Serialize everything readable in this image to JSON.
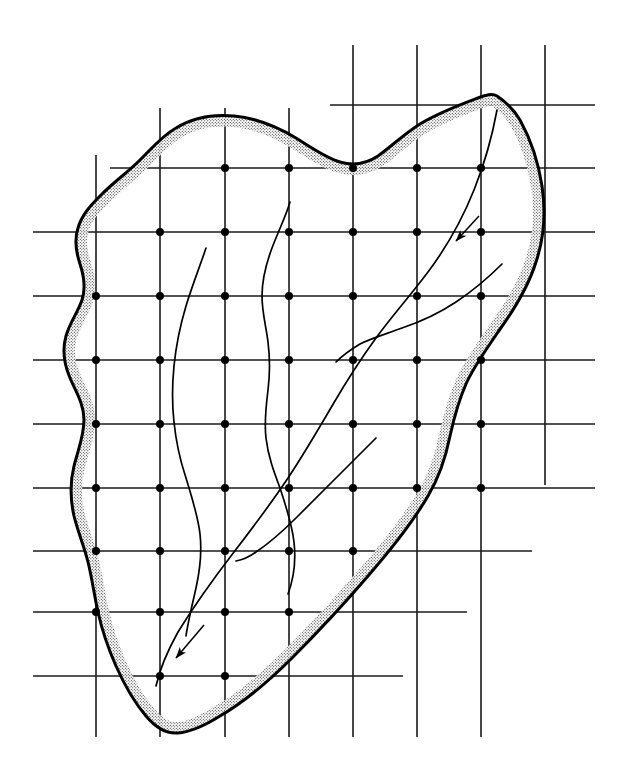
{
  "figure": {
    "kind": "watershed-grid-overlay-diagram",
    "title": "",
    "caption": "",
    "background_color": "#ffffff",
    "ink_color": "#000000",
    "stipple_color": "#000000",
    "canvas": {
      "width": 625,
      "height": 771
    }
  },
  "grid": {
    "name": "sampling-grid",
    "spacing_px": 64,
    "line_color": "#1a1a1a",
    "line_width": 1.6,
    "vertical_lines": [
      {
        "x": 96,
        "y1": 155,
        "y2": 737
      },
      {
        "x": 160,
        "y1": 108,
        "y2": 737
      },
      {
        "x": 225,
        "y1": 108,
        "y2": 737
      },
      {
        "x": 289,
        "y1": 108,
        "y2": 737
      },
      {
        "x": 353,
        "y1": 45,
        "y2": 737
      },
      {
        "x": 417,
        "y1": 45,
        "y2": 737
      },
      {
        "x": 481,
        "y1": 45,
        "y2": 737
      },
      {
        "x": 545,
        "y1": 45,
        "y2": 485
      }
    ],
    "horizontal_lines": [
      {
        "y": 105,
        "x1": 330,
        "x2": 595
      },
      {
        "y": 168,
        "x1": 110,
        "x2": 595
      },
      {
        "y": 232,
        "x1": 33,
        "x2": 595
      },
      {
        "y": 296,
        "x1": 33,
        "x2": 595
      },
      {
        "y": 360,
        "x1": 33,
        "x2": 595
      },
      {
        "y": 424,
        "x1": 33,
        "x2": 595
      },
      {
        "y": 488,
        "x1": 33,
        "x2": 595
      },
      {
        "y": 551,
        "x1": 33,
        "x2": 532
      },
      {
        "y": 612,
        "x1": 33,
        "x2": 467
      },
      {
        "y": 676,
        "x1": 33,
        "x2": 403
      }
    ],
    "node_dot_radius": 4.0,
    "node_dot_color": "#000000",
    "interior_nodes": [
      {
        "x": 225,
        "y": 168
      },
      {
        "x": 289,
        "y": 168
      },
      {
        "x": 353,
        "y": 168
      },
      {
        "x": 417,
        "y": 168
      },
      {
        "x": 481,
        "y": 168
      },
      {
        "x": 160,
        "y": 232
      },
      {
        "x": 225,
        "y": 232
      },
      {
        "x": 289,
        "y": 232
      },
      {
        "x": 353,
        "y": 232
      },
      {
        "x": 417,
        "y": 232
      },
      {
        "x": 481,
        "y": 232
      },
      {
        "x": 96,
        "y": 296
      },
      {
        "x": 160,
        "y": 296
      },
      {
        "x": 225,
        "y": 296
      },
      {
        "x": 289,
        "y": 296
      },
      {
        "x": 353,
        "y": 296
      },
      {
        "x": 417,
        "y": 296
      },
      {
        "x": 481,
        "y": 296
      },
      {
        "x": 96,
        "y": 360
      },
      {
        "x": 160,
        "y": 360
      },
      {
        "x": 225,
        "y": 360
      },
      {
        "x": 289,
        "y": 360
      },
      {
        "x": 353,
        "y": 360
      },
      {
        "x": 417,
        "y": 360
      },
      {
        "x": 481,
        "y": 360
      },
      {
        "x": 96,
        "y": 424
      },
      {
        "x": 160,
        "y": 424
      },
      {
        "x": 225,
        "y": 424
      },
      {
        "x": 289,
        "y": 424
      },
      {
        "x": 353,
        "y": 424
      },
      {
        "x": 417,
        "y": 424
      },
      {
        "x": 481,
        "y": 424
      },
      {
        "x": 96,
        "y": 488
      },
      {
        "x": 160,
        "y": 488
      },
      {
        "x": 225,
        "y": 488
      },
      {
        "x": 289,
        "y": 488
      },
      {
        "x": 353,
        "y": 488
      },
      {
        "x": 417,
        "y": 488
      },
      {
        "x": 481,
        "y": 488
      },
      {
        "x": 96,
        "y": 551
      },
      {
        "x": 160,
        "y": 551
      },
      {
        "x": 225,
        "y": 551
      },
      {
        "x": 289,
        "y": 551
      },
      {
        "x": 353,
        "y": 551
      },
      {
        "x": 96,
        "y": 612
      },
      {
        "x": 160,
        "y": 612
      },
      {
        "x": 225,
        "y": 612
      },
      {
        "x": 289,
        "y": 612
      },
      {
        "x": 160,
        "y": 676
      },
      {
        "x": 225,
        "y": 676
      }
    ],
    "interior_node_count": 51
  },
  "boundary": {
    "name": "watershed-divide",
    "line_width": 3.0,
    "line_color": "#000000",
    "closed": true,
    "path": "M 497 96 C 503 100, 513 108, 520 120 C 530 138, 538 160, 542 186 C 546 212, 544 238, 536 262 C 528 288, 514 310, 498 332 C 486 350, 474 366, 466 384 C 458 402, 454 418, 450 436 C 446 456, 440 476, 428 496 C 414 520, 394 546, 368 576 C 344 604, 318 632, 292 658 C 268 682, 244 702, 220 716 C 204 726, 190 732, 178 733 C 166 734, 156 728, 146 716 C 134 702, 124 684, 116 666 C 108 648, 102 630, 98 612 C 94 594, 92 578, 88 562 C 84 546, 78 532, 74 516 C 70 498, 70 482, 74 466 C 78 450, 84 436, 84 420 C 84 404, 76 392, 70 378 C 64 364, 62 350, 66 336 C 70 322, 78 312, 82 300 C 86 288, 84 276, 80 264 C 76 252, 74 240, 78 228 C 82 214, 92 204, 102 194 C 114 182, 128 172, 140 160 C 152 148, 162 136, 176 128 C 192 118, 212 114, 234 116 C 256 118, 276 126, 296 138 C 312 148, 326 158, 340 162 C 354 166, 366 164, 378 156 C 392 146, 404 134, 420 124 C 440 112, 462 104, 478 98 C 486 95, 492 93, 497 96 Z",
    "stipple_band": {
      "name": "stipple-shading-band",
      "description": "fine dot texture band just inside the divide",
      "width_px": 22,
      "dot_spacing_px": 3,
      "dot_radius_px": 0.55,
      "opacity": 0.9
    }
  },
  "streams": {
    "name": "stream-network",
    "line_width": 1.7,
    "line_color": "#000000",
    "channels": [
      {
        "id": "main-trunk",
        "label": "main channel",
        "path": "M 497 110 C 493 132, 486 160, 474 190 C 462 220, 446 248, 428 272 C 410 296, 392 316, 376 338 C 360 360, 346 382, 332 406 C 318 430, 304 454, 288 478 C 272 502, 254 526, 234 552 C 214 578, 194 606, 178 632 C 168 650, 160 668, 156 686"
      },
      {
        "id": "tributary-right-upper",
        "label": "upper right tributary",
        "path": "M 502 264 C 490 276, 474 290, 456 302 C 438 314, 420 322, 402 328 C 386 334, 372 338, 360 344 C 350 350, 342 356, 336 362"
      },
      {
        "id": "tributary-right-lower",
        "label": "lower right tributary",
        "path": "M 376 438 C 366 448, 352 462, 338 476 C 324 490, 310 504, 296 518 C 282 532, 268 544, 256 552 C 248 558, 242 560, 236 561"
      },
      {
        "id": "tributary-center",
        "label": "center tributary",
        "path": "M 290 202 C 286 216, 278 232, 272 248 C 266 264, 262 280, 262 296 C 262 312, 266 326, 268 342 C 270 358, 270 374, 268 390 C 266 406, 264 422, 266 438 C 268 456, 274 472, 280 488 C 286 506, 292 524, 294 542 C 296 560, 294 578, 288 594"
      },
      {
        "id": "tributary-left",
        "label": "left tributary",
        "path": "M 206 248 C 200 266, 192 286, 186 306 C 180 326, 176 346, 174 366 C 172 386, 172 404, 174 422 C 176 442, 180 460, 186 478 C 192 498, 198 516, 200 534 C 202 552, 200 570, 196 588 C 192 606, 188 622, 186 636"
      }
    ],
    "flow_arrows": [
      {
        "id": "flow-arrow-upper-right",
        "label": "flow direction (downstream, SW)",
        "direction": "southwest",
        "shaft": "M 479 216 L 456 241",
        "tip_x": 453,
        "tip_y": 245,
        "angle_deg": 226
      },
      {
        "id": "flow-arrow-lower-left",
        "label": "flow direction (downstream, SW)",
        "direction": "southwest",
        "shaft": "M 204 625 L 176 658",
        "tip_x": 172,
        "tip_y": 663,
        "angle_deg": 228
      }
    ],
    "arrow_head_length_px": 13,
    "arrow_head_width_px": 7
  }
}
